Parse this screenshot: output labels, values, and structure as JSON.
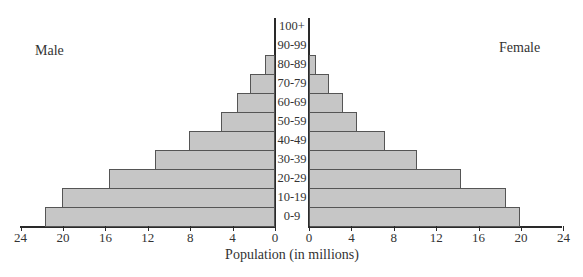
{
  "chart_data": {
    "type": "bar",
    "subtype": "population-pyramid",
    "title": "",
    "xlabel": "Population (in millions)",
    "ylabel": "",
    "categories": [
      "0-9",
      "10-19",
      "20-29",
      "30-39",
      "40-49",
      "50-59",
      "60-69",
      "70-79",
      "80-89",
      "90-99",
      "100+"
    ],
    "series": [
      {
        "name": "Male",
        "side": "left",
        "values": [
          21.7,
          20.1,
          15.7,
          11.3,
          8.1,
          5.1,
          3.6,
          2.4,
          0.9,
          0,
          0
        ]
      },
      {
        "name": "Female",
        "side": "right",
        "values": [
          19.9,
          18.6,
          14.3,
          10.2,
          7.2,
          4.5,
          3.2,
          1.9,
          0.7,
          0,
          0
        ]
      }
    ],
    "xlim": [
      0,
      24
    ],
    "x_ticks": [
      0,
      4,
      8,
      12,
      16,
      20,
      24
    ],
    "grid": false,
    "legend": {
      "left_label": "Male",
      "right_label": "Female"
    }
  },
  "labels": {
    "male": "Male",
    "female": "Female",
    "xlabel": "Population (in millions)"
  },
  "colors": {
    "bar_fill": "#c6c6c6",
    "bar_border": "#555555",
    "axis": "#2a2a2a"
  }
}
